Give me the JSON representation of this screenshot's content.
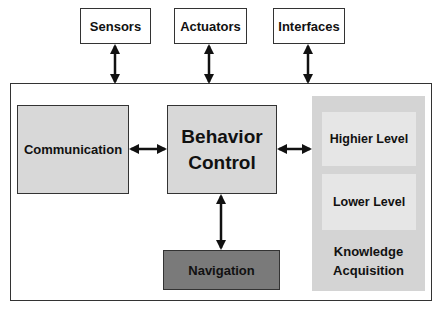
{
  "diagram": {
    "external": [
      {
        "label": "Sensors"
      },
      {
        "label": "Actuators"
      },
      {
        "label": "Interfaces"
      }
    ],
    "modules": {
      "communication": "Communication",
      "behavior_control_line1": "Behavior",
      "behavior_control_line2": "Control",
      "navigation": "Navigation"
    },
    "knowledge": {
      "higher": "Highier Level",
      "lower": "Lower Level",
      "title_line1": "Knowledge",
      "title_line2": "Acquisition"
    },
    "connections": [
      {
        "from": "Sensors",
        "to": "System",
        "type": "bidirectional"
      },
      {
        "from": "Actuators",
        "to": "System",
        "type": "bidirectional"
      },
      {
        "from": "Interfaces",
        "to": "System",
        "type": "bidirectional"
      },
      {
        "from": "Communication",
        "to": "Behavior Control",
        "type": "bidirectional"
      },
      {
        "from": "Behavior Control",
        "to": "Knowledge Acquisition",
        "type": "bidirectional"
      },
      {
        "from": "Behavior Control",
        "to": "Navigation",
        "type": "bidirectional"
      }
    ],
    "colors": {
      "module_fill": "#d8d8d8",
      "navigation_fill": "#7a7a7a",
      "knowledge_fill": "#d4d4d4",
      "knowledge_sub_fill": "#e6e6e6",
      "stroke": "#333333"
    }
  }
}
